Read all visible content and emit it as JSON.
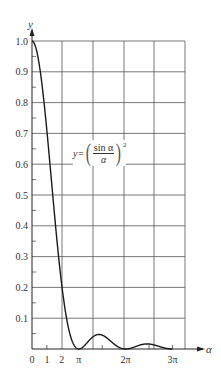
{
  "chart_data": {
    "type": "line",
    "title": "",
    "formula": {
      "lhs": "y=",
      "numerator": "sin α",
      "denominator": "α",
      "exponent": "2"
    },
    "xlabel": "α",
    "ylabel": "y",
    "x_ticks": [
      {
        "label": "0",
        "value": 0
      },
      {
        "label": "1",
        "value": 1
      },
      {
        "label": "2",
        "value": 2
      },
      {
        "label": "π",
        "value": 3.1416
      },
      {
        "label": "2π",
        "value": 6.2832
      },
      {
        "label": "3π",
        "value": 9.4248
      }
    ],
    "y_ticks": [
      "0.1",
      "0.2",
      "0.3",
      "0.4",
      "0.5",
      "0.6",
      "0.7",
      "0.8",
      "0.9",
      "1.0"
    ],
    "xlim": [
      0,
      10.2
    ],
    "ylim": [
      0,
      1.0
    ],
    "grid": true,
    "series": [
      {
        "name": "y = (sin α / α)^2",
        "x": [
          0,
          0.5,
          1.0,
          1.5,
          2.0,
          2.5,
          3.1416,
          3.7,
          4.49,
          5.2,
          6.2832,
          7.0,
          7.725,
          8.5,
          9.4248
        ],
        "values": [
          1.0,
          0.919,
          0.708,
          0.442,
          0.207,
          0.057,
          0.0,
          0.018,
          0.047,
          0.029,
          0.0,
          0.009,
          0.016,
          0.009,
          0.0
        ]
      }
    ]
  }
}
